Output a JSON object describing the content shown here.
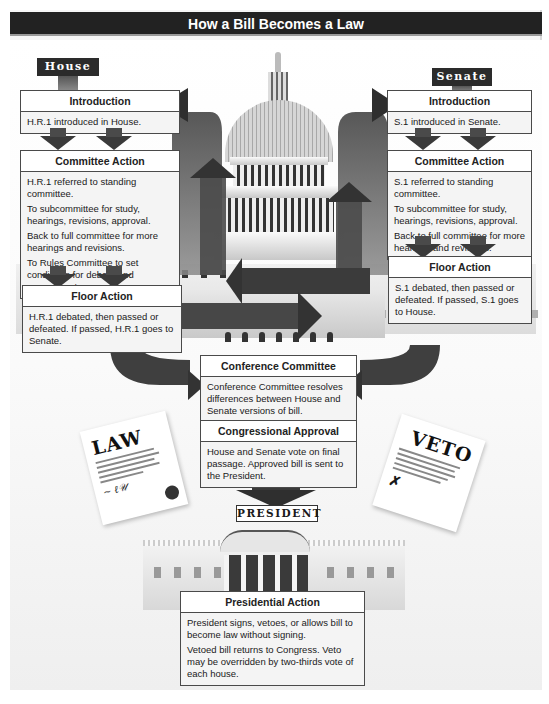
{
  "title": "How a Bill Becomes a Law",
  "house": {
    "label": "House",
    "introduction": {
      "heading": "Introduction",
      "text": "H.R.1 introduced in House."
    },
    "committee_action": {
      "heading": "Committee Action",
      "items": [
        "H.R.1 referred to standing committee.",
        "To subcommittee for study, hearings, revisions, approval.",
        "Back to full committee for more hearings and revisions.",
        "To Rules Committee to set conditions for debate and amendments."
      ]
    },
    "floor_action": {
      "heading": "Floor Action",
      "text": "H.R.1 debated, then passed or defeated. If passed, H.R.1 goes to Senate."
    }
  },
  "senate": {
    "label": "Senate",
    "introduction": {
      "heading": "Introduction",
      "text": "S.1 introduced in Senate."
    },
    "committee_action": {
      "heading": "Committee Action",
      "items": [
        "S.1 referred to standing committee.",
        "To subcommittee for study, hearings, revisions, approval.",
        "Back to full committee for more hearings and revisions."
      ]
    },
    "floor_action": {
      "heading": "Floor Action",
      "text": "S.1 debated, then passed or defeated. If passed, S.1 goes to House."
    }
  },
  "conference_committee": {
    "heading": "Conference Committee",
    "text": "Conference Committee resolves differences between House and Senate versions of bill."
  },
  "congressional_approval": {
    "heading": "Congressional Approval",
    "text": "House and Senate vote on final passage. Approved bill is sent to the President."
  },
  "president": {
    "label": "President",
    "presidential_action": {
      "heading": "Presidential Action",
      "items": [
        "President signs, vetoes, or allows bill to become law without signing.",
        "Vetoed bill returns to Congress. Veto may be overridden by two-thirds vote of each house."
      ]
    }
  },
  "documents": {
    "law": "LAW",
    "veto": "VETO"
  },
  "colors": {
    "title_bar": "#222222",
    "label_bg": "#2b2b2b",
    "arrow": "#3a3a3a",
    "box_border": "#4a4a4a"
  }
}
